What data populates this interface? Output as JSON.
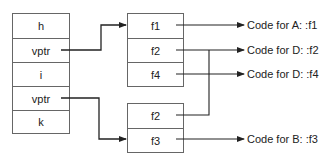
{
  "object_layout": {
    "fields": [
      "h",
      "vptr",
      "i",
      "vptr",
      "k"
    ]
  },
  "vtables": [
    {
      "entries": [
        "f1",
        "f2",
        "f4"
      ]
    },
    {
      "entries": [
        "f2",
        "f3"
      ]
    }
  ],
  "targets": [
    "Code for A: :f1",
    "Code for D: :f2",
    "Code for D: :f4",
    "Code for B: :f3"
  ],
  "colors": {
    "line": "#222222",
    "border": "#666666"
  }
}
